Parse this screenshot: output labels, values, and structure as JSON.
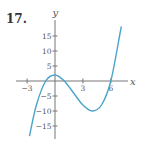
{
  "problem_number": "17.",
  "chart_data": {
    "type": "line",
    "title": "",
    "xlabel": "x",
    "ylabel": "y",
    "xlim": [
      -4,
      8.3
    ],
    "ylim": [
      -19,
      20
    ],
    "x_ticks": [
      {
        "value": -3,
        "label": "−3"
      },
      {
        "value": 3,
        "label": "3"
      },
      {
        "value": 6,
        "label": "6"
      }
    ],
    "y_ticks": [
      {
        "value": 15,
        "label": "15"
      },
      {
        "value": 10,
        "label": "10"
      },
      {
        "value": 5,
        "label": "5"
      },
      {
        "value": -5,
        "label": "−5"
      },
      {
        "value": -10,
        "label": "−10"
      },
      {
        "value": -15,
        "label": "−15"
      }
    ],
    "grid": false,
    "series": [
      {
        "name": "f(x)",
        "color": "#4aa3c8",
        "description": "cubic with roots at x=-1, 1, 6; local max near (0, 2), local min near (4.1, -10)",
        "x_range": [
          -2.75,
          7.12
        ],
        "points": [
          [
            -2.75,
            -18.4
          ],
          [
            -2,
            -8.0
          ],
          [
            -1,
            0
          ],
          [
            0,
            2
          ],
          [
            1,
            0
          ],
          [
            2,
            -4
          ],
          [
            3,
            -8
          ],
          [
            4,
            -10
          ],
          [
            5,
            -8
          ],
          [
            6,
            0
          ],
          [
            7,
            16
          ],
          [
            7.12,
            18.1
          ]
        ]
      }
    ]
  }
}
